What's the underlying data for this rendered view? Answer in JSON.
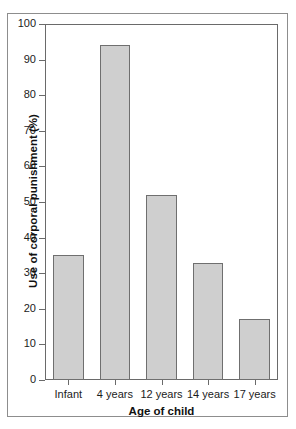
{
  "chart_data": {
    "type": "bar",
    "title": "",
    "categories": [
      "Infant",
      "4 years",
      "12 years",
      "14 years",
      "17 years"
    ],
    "values": [
      35,
      94,
      52,
      33,
      17
    ],
    "xlabel": "Age of child",
    "ylabel": "Use of corporal punishment (%)",
    "ylim": [
      0,
      100
    ],
    "ytick_labels": [
      "0",
      "10",
      "20",
      "30",
      "40",
      "50",
      "60",
      "70",
      "80",
      "90",
      "100"
    ],
    "ytick_values": [
      0,
      10,
      20,
      30,
      40,
      50,
      60,
      70,
      80,
      90,
      100
    ],
    "grid": false,
    "legend": null,
    "bar_fill_color": "#cfcfcf",
    "bar_edge_color": "#6f6f6f",
    "axis_color": "#6a6a6a",
    "background_color": "#ffffff"
  }
}
